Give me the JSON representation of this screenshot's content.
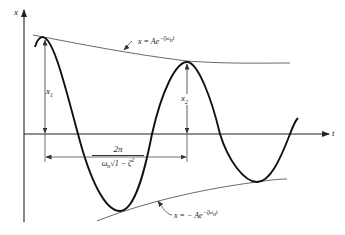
{
  "figure": {
    "axes": {
      "y_label": "x",
      "x_label": "t"
    },
    "labels": {
      "x1": "x",
      "x1_sub": "1",
      "x2": "x",
      "x2_sub": "2",
      "upper_envelope": "x = Ae",
      "upper_envelope_exp": "−ζω",
      "upper_envelope_exp_sub": "n",
      "upper_envelope_exp_t": "t",
      "lower_envelope": "x = − Ae",
      "lower_envelope_exp": "−ζω",
      "lower_envelope_exp_sub": "n",
      "lower_envelope_exp_t": "t",
      "period_numerator": "2π",
      "period_denominator_prefix": "ω",
      "period_denominator_sub": "n",
      "period_denominator_root": "√1 − ζ",
      "period_denominator_sup": "2"
    },
    "colors": {
      "curve": "#111111",
      "envelope": "#444444",
      "axis": "#222222",
      "background": "#ffffff"
    }
  }
}
